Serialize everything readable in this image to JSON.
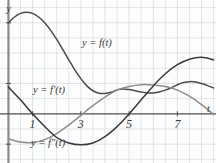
{
  "chart_data": {
    "type": "line",
    "title": "",
    "xlabel": "t",
    "ylabel": "y",
    "grid": true,
    "grid_spacing": 0.5,
    "xlim": [
      -0.35,
      8.6
    ],
    "ylim": [
      -1.62,
      3.75
    ],
    "xticks": [
      1,
      3,
      5,
      7
    ],
    "xticklabels": [
      "1",
      "3",
      "5",
      "7"
    ],
    "yticks": [
      3,
      1,
      -1
    ],
    "yticklabels": [
      "3",
      "1",
      "-1"
    ],
    "legend_position": "inline-annotations",
    "series": [
      {
        "name": "y = f(t)",
        "label": "y = f(t)",
        "color": "#4a4a4a",
        "width": 1.5,
        "x": [
          0,
          0.25,
          0.5,
          0.75,
          1,
          1.25,
          1.5,
          1.75,
          2,
          2.25,
          2.5,
          2.75,
          3,
          3.25,
          3.5,
          3.75,
          4,
          4.25,
          4.5,
          4.75,
          5,
          5.25,
          5.5,
          5.75,
          6,
          6.25,
          6.5,
          6.75,
          7,
          7.25,
          7.5,
          7.75,
          8,
          8.25,
          8.5
        ],
        "y": [
          3.0,
          3.19,
          3.31,
          3.35,
          3.31,
          3.19,
          3.0,
          2.75,
          2.45,
          2.12,
          1.78,
          1.45,
          1.16,
          0.92,
          0.76,
          0.68,
          0.67,
          0.71,
          0.79,
          0.82,
          0.8,
          0.76,
          0.72,
          0.69,
          0.69,
          0.72,
          0.78,
          0.86,
          0.96,
          1.03,
          1.06,
          1.05,
          1.0,
          0.93,
          0.85
        ]
      },
      {
        "name": "y = f'(t)",
        "label": "y = f'(t)",
        "color": "#8e8e8e",
        "width": 1.5,
        "x": [
          0,
          0.5,
          1,
          1.5,
          2,
          2.5,
          3,
          3.5,
          4,
          4.5,
          5,
          5.5,
          6,
          6.5,
          7,
          7.5,
          8,
          8.5
        ],
        "y": [
          -0.82,
          -0.93,
          -0.95,
          -0.85,
          -0.65,
          -0.37,
          -0.05,
          0.27,
          0.55,
          0.78,
          0.9,
          0.96,
          0.95,
          0.9,
          0.78,
          0.58,
          0.3,
          -0.02
        ]
      },
      {
        "name": "y = f''(t)",
        "label": "y = f''(t)",
        "color": "#3a3a3a",
        "width": 1.5,
        "x": [
          0,
          0.5,
          1,
          1.5,
          2,
          2.5,
          3,
          3.5,
          4,
          4.5,
          5,
          5.5,
          6,
          6.5,
          7,
          7.5,
          8,
          8.5
        ],
        "y": [
          0.88,
          0.46,
          0.0,
          -0.42,
          -0.78,
          -0.96,
          -1.02,
          -0.96,
          -0.75,
          -0.42,
          0.0,
          0.46,
          0.92,
          1.32,
          1.62,
          1.8,
          1.86,
          1.78
        ]
      }
    ],
    "annotations": [
      {
        "text": "y = f(t)",
        "x_px": 82,
        "y_px": 38
      },
      {
        "text": "y = f'(t)",
        "x_px": 33,
        "y_px": 85
      },
      {
        "text": "y = f″(t)",
        "x_px": 31,
        "y_px": 138
      }
    ],
    "axis_labels": {
      "y_axis": "y",
      "t_axis": "t"
    },
    "colors": {
      "grid": "#cfd8e0",
      "axis": "#8a8a8a",
      "tick_text": "#3a3a3a",
      "background": "#fdfdfd"
    }
  }
}
